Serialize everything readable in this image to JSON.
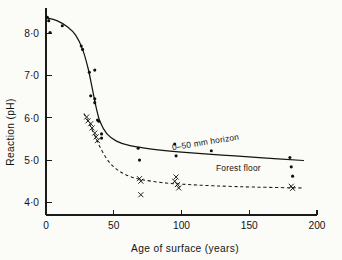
{
  "figure": {
    "background_color": "#fbfbf8",
    "ink_color": "#141414"
  },
  "chart_data": {
    "type": "scatter",
    "title": "",
    "subtitle": "",
    "xlabel": "Age  of  surface  (years)",
    "ylabel": "Reaction  (pH)",
    "xlim": [
      0,
      200
    ],
    "ylim": [
      3.7,
      8.6
    ],
    "grid": false,
    "legend_position": "inline-annotation",
    "xticks": [
      0,
      50,
      100,
      150,
      200
    ],
    "xticklabels": [
      "0",
      "50",
      "100",
      "150",
      "200"
    ],
    "yticks": [
      4.0,
      5.0,
      6.0,
      7.0,
      8.0
    ],
    "yticklabels": [
      "4·0",
      "5·0",
      "6·0",
      "7·0",
      "8·0"
    ],
    "annotations": [
      {
        "id": "label-horizon",
        "text": "0–50 mm horizon",
        "x": 118,
        "y": 5.36,
        "rotation": -9,
        "refers_to": "0-50mm horizon"
      },
      {
        "id": "label-forest-floor",
        "text": "Forest floor",
        "x": 142,
        "y": 4.74,
        "rotation": 0,
        "refers_to": "Forest floor"
      }
    ],
    "series": [
      {
        "name": "0–50 mm horizon",
        "marker": "filled-circle",
        "linestyle": "solid",
        "color": "#141414",
        "points": [
          {
            "x": 1,
            "y": 8.38
          },
          {
            "x": 2,
            "y": 8.3
          },
          {
            "x": 3,
            "y": 8.02
          },
          {
            "x": 12,
            "y": 8.18
          },
          {
            "x": 26,
            "y": 7.7
          },
          {
            "x": 27,
            "y": 7.62
          },
          {
            "x": 32,
            "y": 7.08
          },
          {
            "x": 36,
            "y": 7.13
          },
          {
            "x": 33,
            "y": 6.52
          },
          {
            "x": 36,
            "y": 6.45
          },
          {
            "x": 36,
            "y": 6.36
          },
          {
            "x": 38,
            "y": 5.95
          },
          {
            "x": 39,
            "y": 5.92
          },
          {
            "x": 41,
            "y": 5.62
          },
          {
            "x": 41,
            "y": 5.52
          },
          {
            "x": 68,
            "y": 5.28
          },
          {
            "x": 69,
            "y": 5.0
          },
          {
            "x": 95,
            "y": 5.38
          },
          {
            "x": 96,
            "y": 5.1
          },
          {
            "x": 122,
            "y": 5.22
          },
          {
            "x": 180,
            "y": 5.06
          },
          {
            "x": 181,
            "y": 4.84
          },
          {
            "x": 182,
            "y": 4.62
          }
        ],
        "curve": [
          {
            "x": 0,
            "y": 8.37
          },
          {
            "x": 8,
            "y": 8.3
          },
          {
            "x": 16,
            "y": 8.15
          },
          {
            "x": 22,
            "y": 7.95
          },
          {
            "x": 27,
            "y": 7.62
          },
          {
            "x": 31,
            "y": 7.18
          },
          {
            "x": 34,
            "y": 6.72
          },
          {
            "x": 37,
            "y": 6.25
          },
          {
            "x": 40,
            "y": 5.9
          },
          {
            "x": 45,
            "y": 5.62
          },
          {
            "x": 52,
            "y": 5.45
          },
          {
            "x": 62,
            "y": 5.34
          },
          {
            "x": 78,
            "y": 5.26
          },
          {
            "x": 100,
            "y": 5.19
          },
          {
            "x": 130,
            "y": 5.12
          },
          {
            "x": 160,
            "y": 5.05
          },
          {
            "x": 190,
            "y": 4.99
          }
        ]
      },
      {
        "name": "Forest floor",
        "marker": "cross",
        "linestyle": "dashed",
        "color": "#1b1b1b",
        "points": [
          {
            "x": 30,
            "y": 6.02
          },
          {
            "x": 31,
            "y": 5.93
          },
          {
            "x": 33,
            "y": 5.86
          },
          {
            "x": 34,
            "y": 5.76
          },
          {
            "x": 36,
            "y": 5.64
          },
          {
            "x": 37,
            "y": 5.55
          },
          {
            "x": 38,
            "y": 5.46
          },
          {
            "x": 69,
            "y": 4.56
          },
          {
            "x": 70,
            "y": 4.5
          },
          {
            "x": 70,
            "y": 4.18
          },
          {
            "x": 95,
            "y": 4.5
          },
          {
            "x": 96,
            "y": 4.6
          },
          {
            "x": 97,
            "y": 4.42
          },
          {
            "x": 98,
            "y": 4.34
          },
          {
            "x": 181,
            "y": 4.38
          },
          {
            "x": 182,
            "y": 4.33
          }
        ],
        "curve": [
          {
            "x": 28,
            "y": 6.1
          },
          {
            "x": 32,
            "y": 5.86
          },
          {
            "x": 36,
            "y": 5.58
          },
          {
            "x": 40,
            "y": 5.3
          },
          {
            "x": 45,
            "y": 5.02
          },
          {
            "x": 50,
            "y": 4.84
          },
          {
            "x": 56,
            "y": 4.7
          },
          {
            "x": 63,
            "y": 4.6
          },
          {
            "x": 72,
            "y": 4.53
          },
          {
            "x": 85,
            "y": 4.47
          },
          {
            "x": 100,
            "y": 4.43
          },
          {
            "x": 125,
            "y": 4.39
          },
          {
            "x": 155,
            "y": 4.36
          },
          {
            "x": 190,
            "y": 4.34
          }
        ]
      }
    ]
  }
}
